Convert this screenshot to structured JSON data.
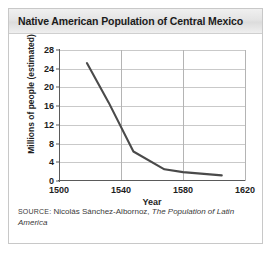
{
  "card": {
    "title": "Native American Population of Central Mexico"
  },
  "source": {
    "kicker": "SOURCE:",
    "author": " Nicolás Sánchez-Albornoz, ",
    "work": "The Population of Latin America"
  },
  "colors": {
    "line": "#4a4a4a",
    "gridline": "#c9c9c9",
    "axis": "#5a5a5a",
    "title_text": "#1b1b1b",
    "header_band": "#e4e4e4",
    "card_border": "#c8c8c8",
    "plot_background": "#ffffff"
  },
  "chart_data": {
    "type": "line",
    "title": "Native American Population of Central Mexico",
    "xlabel": "Year",
    "ylabel": "Millions of people (estimated)",
    "xlim": [
      1500,
      1620
    ],
    "ylim": [
      0,
      28
    ],
    "xticks": [
      1500,
      1540,
      1580,
      1620
    ],
    "yticks": [
      0,
      4,
      8,
      12,
      16,
      20,
      24,
      28
    ],
    "grid": true,
    "legend": null,
    "series": [
      {
        "name": "Native American population of Central Mexico",
        "x": [
          1518,
          1532,
          1548,
          1568,
          1580,
          1605
        ],
        "values": [
          25.2,
          16.8,
          6.3,
          2.5,
          1.9,
          1.2
        ]
      }
    ]
  }
}
